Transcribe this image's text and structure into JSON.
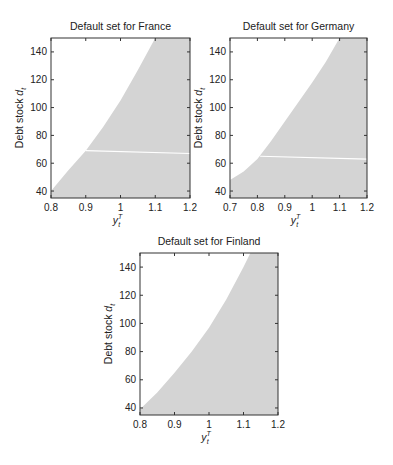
{
  "figure": {
    "panels": [
      {
        "id": "france",
        "title": "Default set for France",
        "ylabel": "Debt stock",
        "ylabel_symbol": "d",
        "ylabel_sub": "t",
        "xlabel_symbol": "y",
        "xlabel_sub": "t",
        "xlabel_sup": "T",
        "xticks": [
          "0.8",
          "0.9",
          "1",
          "1.1",
          "1.2"
        ],
        "yticks": [
          "40",
          "60",
          "80",
          "100",
          "120",
          "140"
        ]
      },
      {
        "id": "germany",
        "title": "Default set for Germany",
        "ylabel": "Debt stock",
        "ylabel_symbol": "d",
        "ylabel_sub": "t",
        "xlabel_symbol": "y",
        "xlabel_sub": "t",
        "xlabel_sup": "T",
        "xticks": [
          "0.7",
          "0.8",
          "0.9",
          "1",
          "1.1",
          "1.2"
        ],
        "yticks": [
          "40",
          "60",
          "80",
          "100",
          "120",
          "140"
        ]
      },
      {
        "id": "finland",
        "title": "Default set for Finland",
        "ylabel": "Debt stock",
        "ylabel_symbol": "d",
        "ylabel_sub": "t",
        "xlabel_symbol": "y",
        "xlabel_sub": "t",
        "xlabel_sup": "T",
        "xticks": [
          "0.8",
          "0.9",
          "1",
          "1.1",
          "1.2"
        ],
        "yticks": [
          "40",
          "60",
          "80",
          "100",
          "120",
          "140"
        ]
      }
    ],
    "colors": {
      "default_region": "#d4d4d4",
      "background": "#ffffff",
      "axis": "#333333",
      "threshold_line": "#ffffff"
    }
  },
  "chart_data": [
    {
      "type": "area",
      "title": "Default set for France",
      "xlabel": "y_t^T",
      "ylabel": "Debt stock d_t",
      "xlim": [
        0.8,
        1.2
      ],
      "ylim": [
        35,
        150
      ],
      "xticks": [
        0.8,
        0.9,
        1.0,
        1.1,
        1.2
      ],
      "yticks": [
        40,
        60,
        80,
        100,
        120,
        140
      ],
      "grid": false,
      "legend": null,
      "description": "Shaded gray region (default set) lies below/right of boundary curve",
      "boundary": {
        "x": [
          0.8,
          0.85,
          0.9,
          0.95,
          1.0,
          1.05,
          1.1
        ],
        "y": [
          40,
          55,
          69,
          86,
          105,
          127,
          150
        ]
      },
      "threshold_line": {
        "x": [
          0.9,
          1.2
        ],
        "y": [
          69,
          67
        ]
      }
    },
    {
      "type": "area",
      "title": "Default set for Germany",
      "xlabel": "y_t^T",
      "ylabel": "Debt stock d_t",
      "xlim": [
        0.7,
        1.2
      ],
      "ylim": [
        35,
        150
      ],
      "xticks": [
        0.7,
        0.8,
        0.9,
        1.0,
        1.1,
        1.2
      ],
      "yticks": [
        40,
        60,
        80,
        100,
        120,
        140
      ],
      "grid": false,
      "legend": null,
      "description": "Shaded gray region (default set) lies below/right of boundary curve",
      "boundary": {
        "x": [
          0.7,
          0.75,
          0.8,
          0.85,
          0.9,
          0.95,
          1.0,
          1.05,
          1.1
        ],
        "y": [
          48,
          54,
          63,
          76,
          90,
          104,
          118,
          133,
          150
        ]
      },
      "threshold_line": {
        "x": [
          0.81,
          1.2
        ],
        "y": [
          65,
          63
        ]
      }
    },
    {
      "type": "area",
      "title": "Default set for Finland",
      "xlabel": "y_t^T",
      "ylabel": "Debt stock d_t",
      "xlim": [
        0.8,
        1.2
      ],
      "ylim": [
        35,
        150
      ],
      "xticks": [
        0.8,
        0.9,
        1.0,
        1.1,
        1.2
      ],
      "yticks": [
        40,
        60,
        80,
        100,
        120,
        140
      ],
      "grid": false,
      "legend": null,
      "description": "Shaded gray region (default set) lies below/right of boundary curve",
      "boundary": {
        "x": [
          0.8,
          0.85,
          0.9,
          0.95,
          1.0,
          1.05,
          1.1,
          1.12
        ],
        "y": [
          39,
          51,
          65,
          80,
          97,
          117,
          140,
          150
        ]
      },
      "threshold_line": null
    }
  ]
}
